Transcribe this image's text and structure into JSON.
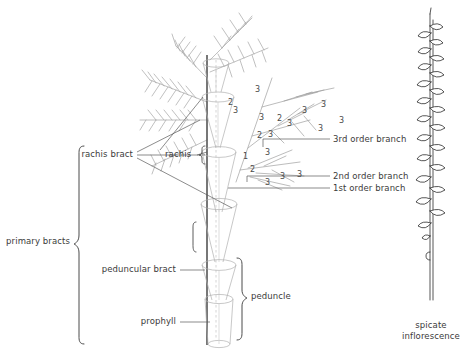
{
  "figure": {
    "title_left": "",
    "colors": {
      "ink": "#3b3b3b",
      "branch": "#9a9a9a",
      "bract_outline": "#a8a8a8",
      "axis": "#4a4a4a",
      "leader": "#5a5a5a",
      "spike": "#2b2b2b",
      "background": "#ffffff"
    }
  },
  "labels": {
    "rachis_bract": "rachis bract",
    "rachis": "rachis",
    "primary_bracts": "primary bracts",
    "peduncular_bract": "peduncular bract",
    "prophyll": "prophyll",
    "peduncle": "peduncle",
    "third_order_branch": "3rd order branch",
    "second_order_branch": "2nd order branch",
    "first_order_branch": "1st order branch",
    "spicate_inflorescence_line1": "spicate",
    "spicate_inflorescence_line2": "inflorescence"
  },
  "branch_orders": {
    "note": "numeric annotations marking branching order on the panicle",
    "items": [
      {
        "value": "1",
        "x": 243,
        "y": 152
      },
      {
        "value": "2",
        "x": 228,
        "y": 98
      },
      {
        "value": "2",
        "x": 257,
        "y": 131
      },
      {
        "value": "2",
        "x": 250,
        "y": 165
      },
      {
        "value": "2",
        "x": 277,
        "y": 114
      },
      {
        "value": "3",
        "x": 233,
        "y": 106
      },
      {
        "value": "3",
        "x": 255,
        "y": 85
      },
      {
        "value": "3",
        "x": 259,
        "y": 113
      },
      {
        "value": "3",
        "x": 268,
        "y": 130
      },
      {
        "value": "3",
        "x": 287,
        "y": 119
      },
      {
        "value": "3",
        "x": 302,
        "y": 106
      },
      {
        "value": "3",
        "x": 321,
        "y": 100
      },
      {
        "value": "3",
        "x": 318,
        "y": 124
      },
      {
        "value": "3",
        "x": 339,
        "y": 116
      },
      {
        "value": "3",
        "x": 265,
        "y": 148
      },
      {
        "value": "3",
        "x": 280,
        "y": 172
      },
      {
        "value": "3",
        "x": 265,
        "y": 178
      },
      {
        "value": "3",
        "x": 297,
        "y": 170
      }
    ]
  },
  "icons": {
    "brace_primary_bracts": "curly-brace-icon",
    "brace_peduncle": "curly-brace-icon",
    "brace_rachis": "curly-brace-icon",
    "leader_line": "leader-line-icon"
  }
}
